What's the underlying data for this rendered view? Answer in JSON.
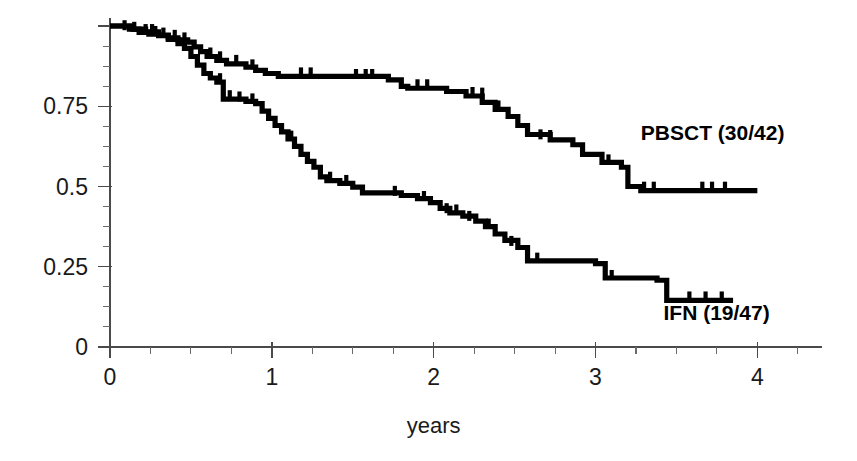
{
  "chart_data": {
    "type": "line",
    "title": "",
    "subtitle": "",
    "xlabel": "years",
    "ylabel": "",
    "xlim": [
      0,
      4.35
    ],
    "ylim": [
      0,
      1.0
    ],
    "grid": false,
    "legend_position": "inline-right",
    "x_ticks": [
      0,
      1,
      2,
      3,
      4
    ],
    "x_tick_labels": [
      "0",
      "1",
      "2",
      "3",
      "4"
    ],
    "x_minor_tick_step": 0.25,
    "y_ticks": [
      0,
      0.25,
      0.5,
      0.75,
      1.0
    ],
    "y_tick_labels": [
      "0",
      "0.25",
      "0.5",
      "0.75",
      ""
    ],
    "y_minor_tick_step": 0.0625,
    "curve_style": "kaplan-meier-step",
    "series": [
      {
        "name": "PBSCT (30/42)",
        "label": "PBSCT (30/42)",
        "color": "#000000",
        "label_x": 3.28,
        "label_y": 0.645,
        "n_events": 30,
        "n_total": 42,
        "final_value": 0.487,
        "points": [
          [
            0.0,
            1.0
          ],
          [
            0.12,
            0.99
          ],
          [
            0.18,
            0.98
          ],
          [
            0.24,
            0.975
          ],
          [
            0.3,
            0.97
          ],
          [
            0.36,
            0.963
          ],
          [
            0.42,
            0.957
          ],
          [
            0.48,
            0.95
          ],
          [
            0.52,
            0.935
          ],
          [
            0.56,
            0.92
          ],
          [
            0.6,
            0.905
          ],
          [
            0.66,
            0.893
          ],
          [
            0.72,
            0.882
          ],
          [
            0.84,
            0.872
          ],
          [
            0.9,
            0.862
          ],
          [
            0.96,
            0.852
          ],
          [
            1.04,
            0.843
          ],
          [
            1.72,
            0.832
          ],
          [
            1.8,
            0.812
          ],
          [
            1.84,
            0.806
          ],
          [
            2.08,
            0.796
          ],
          [
            2.2,
            0.782
          ],
          [
            2.3,
            0.762
          ],
          [
            2.38,
            0.74
          ],
          [
            2.46,
            0.718
          ],
          [
            2.52,
            0.69
          ],
          [
            2.58,
            0.662
          ],
          [
            2.72,
            0.645
          ],
          [
            2.86,
            0.63
          ],
          [
            2.92,
            0.6
          ],
          [
            3.04,
            0.575
          ],
          [
            3.16,
            0.56
          ],
          [
            3.2,
            0.5
          ],
          [
            3.28,
            0.487
          ],
          [
            4.0,
            0.487
          ]
        ],
        "censor_marks": [
          [
            0.09,
            0.99
          ],
          [
            0.15,
            0.985
          ],
          [
            0.22,
            0.978
          ],
          [
            0.28,
            0.972
          ],
          [
            0.33,
            0.967
          ],
          [
            0.4,
            0.96
          ],
          [
            0.46,
            0.952
          ],
          [
            0.62,
            0.905
          ],
          [
            0.68,
            0.893
          ],
          [
            0.78,
            0.882
          ],
          [
            0.88,
            0.868
          ],
          [
            1.18,
            0.843
          ],
          [
            1.24,
            0.843
          ],
          [
            1.52,
            0.838
          ],
          [
            1.58,
            0.838
          ],
          [
            1.62,
            0.838
          ],
          [
            1.9,
            0.806
          ],
          [
            1.96,
            0.806
          ],
          [
            2.24,
            0.782
          ],
          [
            2.3,
            0.78
          ],
          [
            2.4,
            0.74
          ],
          [
            2.66,
            0.65
          ],
          [
            2.72,
            0.648
          ],
          [
            3.08,
            0.572
          ],
          [
            3.3,
            0.487
          ],
          [
            3.36,
            0.487
          ],
          [
            3.66,
            0.487
          ],
          [
            3.72,
            0.487
          ],
          [
            3.8,
            0.487
          ]
        ]
      },
      {
        "name": "IFN (19/47)",
        "label": "IFN (19/47)",
        "color": "#000000",
        "label_x": 3.42,
        "label_y": 0.085,
        "n_events": 19,
        "n_total": 47,
        "final_value": 0.145,
        "points": [
          [
            0.0,
            1.0
          ],
          [
            0.14,
            0.99
          ],
          [
            0.22,
            0.982
          ],
          [
            0.3,
            0.972
          ],
          [
            0.36,
            0.958
          ],
          [
            0.42,
            0.945
          ],
          [
            0.46,
            0.93
          ],
          [
            0.5,
            0.905
          ],
          [
            0.54,
            0.878
          ],
          [
            0.58,
            0.852
          ],
          [
            0.62,
            0.838
          ],
          [
            0.66,
            0.825
          ],
          [
            0.7,
            0.772
          ],
          [
            0.84,
            0.765
          ],
          [
            0.9,
            0.758
          ],
          [
            0.94,
            0.735
          ],
          [
            0.98,
            0.712
          ],
          [
            1.02,
            0.69
          ],
          [
            1.06,
            0.67
          ],
          [
            1.1,
            0.648
          ],
          [
            1.14,
            0.625
          ],
          [
            1.18,
            0.6
          ],
          [
            1.22,
            0.578
          ],
          [
            1.26,
            0.56
          ],
          [
            1.3,
            0.53
          ],
          [
            1.34,
            0.518
          ],
          [
            1.42,
            0.51
          ],
          [
            1.5,
            0.498
          ],
          [
            1.56,
            0.48
          ],
          [
            1.8,
            0.472
          ],
          [
            1.9,
            0.462
          ],
          [
            1.98,
            0.45
          ],
          [
            2.04,
            0.432
          ],
          [
            2.1,
            0.418
          ],
          [
            2.18,
            0.408
          ],
          [
            2.26,
            0.392
          ],
          [
            2.32,
            0.375
          ],
          [
            2.38,
            0.352
          ],
          [
            2.44,
            0.332
          ],
          [
            2.52,
            0.31
          ],
          [
            2.58,
            0.268
          ],
          [
            3.0,
            0.26
          ],
          [
            3.06,
            0.215
          ],
          [
            3.38,
            0.208
          ],
          [
            3.44,
            0.145
          ],
          [
            3.85,
            0.145
          ]
        ],
        "censor_marks": [
          [
            0.26,
            0.978
          ],
          [
            0.68,
            0.825
          ],
          [
            0.74,
            0.772
          ],
          [
            0.8,
            0.768
          ],
          [
            0.88,
            0.762
          ],
          [
            1.06,
            0.668
          ],
          [
            1.12,
            0.646
          ],
          [
            1.36,
            0.518
          ],
          [
            1.46,
            0.508
          ],
          [
            1.76,
            0.474
          ],
          [
            1.94,
            0.458
          ],
          [
            2.08,
            0.42
          ],
          [
            2.14,
            0.416
          ],
          [
            2.22,
            0.396
          ],
          [
            2.34,
            0.372
          ],
          [
            2.48,
            0.318
          ],
          [
            2.64,
            0.266
          ],
          [
            3.1,
            0.212
          ],
          [
            3.58,
            0.145
          ],
          [
            3.68,
            0.145
          ],
          [
            3.78,
            0.145
          ]
        ]
      }
    ]
  },
  "axes": {
    "x_title": "years",
    "y_title": ""
  }
}
